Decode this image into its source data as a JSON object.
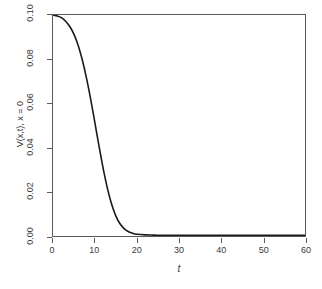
{
  "chart_data": {
    "type": "line",
    "title": "",
    "xlabel": "t",
    "ylabel": "V(x,t), x = 0",
    "xlim": [
      0,
      60
    ],
    "ylim": [
      0.0,
      0.1
    ],
    "grid": false,
    "legend": null,
    "xticks": [
      {
        "value": 0,
        "label": "0"
      },
      {
        "value": 10,
        "label": "10"
      },
      {
        "value": 20,
        "label": "20"
      },
      {
        "value": 30,
        "label": "30"
      },
      {
        "value": 40,
        "label": "40"
      },
      {
        "value": 50,
        "label": "50"
      },
      {
        "value": 60,
        "label": "60"
      }
    ],
    "yticks": [
      {
        "value": 0.0,
        "label": "0.00"
      },
      {
        "value": 0.02,
        "label": "0.02"
      },
      {
        "value": 0.04,
        "label": "0.04"
      },
      {
        "value": 0.06,
        "label": "0.06"
      },
      {
        "value": 0.08,
        "label": "0.08"
      },
      {
        "value": 0.1,
        "label": "0.10"
      }
    ],
    "series": [
      {
        "name": "V(x,t), x = 0",
        "color": "#1a1a1a",
        "line_width": 1.6,
        "x": [
          0,
          1,
          2,
          3,
          4,
          5,
          6,
          7,
          8,
          9,
          10,
          11,
          12,
          13,
          14,
          15,
          16,
          17,
          18,
          19,
          20,
          22,
          24,
          26,
          28,
          30,
          35,
          40,
          45,
          50,
          55,
          60
        ],
        "y": [
          0.1,
          0.0996,
          0.0988,
          0.0972,
          0.0948,
          0.0912,
          0.0862,
          0.0795,
          0.0712,
          0.0616,
          0.051,
          0.0402,
          0.03,
          0.0212,
          0.0141,
          0.0089,
          0.0054,
          0.0032,
          0.0019,
          0.0012,
          0.0008,
          0.0005,
          0.0004,
          0.0003,
          0.0003,
          0.0003,
          0.0003,
          0.0003,
          0.0003,
          0.0003,
          0.0003,
          0.0003
        ]
      }
    ]
  },
  "axes": {
    "frame_color": "#5a5a5a",
    "text_color": "#3a3a3a",
    "background": "#ffffff"
  }
}
